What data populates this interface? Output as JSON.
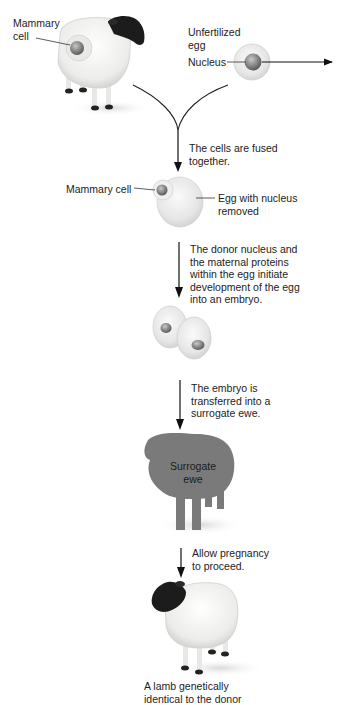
{
  "diagram": {
    "title_cut": "Donor",
    "donor": {
      "label_mammary": "Mammary",
      "label_cell": "cell"
    },
    "egg": {
      "label_line1": "Unfertilized",
      "label_line2": "egg",
      "nucleus_label": "Nucleus"
    },
    "steps": [
      {
        "line1": "The cells are fused",
        "line2": "together."
      },
      {
        "line1": "The donor nucleus and",
        "line2": "the maternal proteins",
        "line3": "within the egg initiate",
        "line4": "development of the egg",
        "line5": "into an embryo."
      },
      {
        "line1": "The embryo is",
        "line2": "transferred into a",
        "line3": "surrogate ewe."
      },
      {
        "line1": "Allow pregnancy",
        "line2": "to proceed."
      }
    ],
    "fused": {
      "mammary_label": "Mammary cell",
      "egg_label_line1": "Egg with nucleus",
      "egg_label_line2": "removed"
    },
    "surrogate": {
      "line1": "Surrogate",
      "line2": "ewe"
    },
    "result": {
      "line1": "A lamb genetically",
      "line2": "identical to the donor"
    },
    "colors": {
      "arrow": "#111111",
      "surrogate_fill": "#7a7a7a",
      "wool": "#f2f2f0",
      "face": "#1c1c1c",
      "cell_fill": "#ececec",
      "nucleus": "#8a8a8a"
    }
  }
}
